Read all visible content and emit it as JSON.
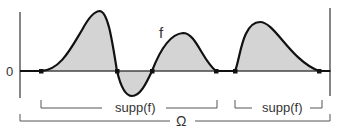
{
  "diagram": {
    "function_label": "f",
    "zero_label": "0",
    "support_labels": [
      "supp(f)",
      "supp(f)"
    ],
    "domain_label": "Ω",
    "colors": {
      "curve": "#111111",
      "fill": "#d4d4d4",
      "axis": "#444444",
      "bracket": "#555555",
      "text": "#333333"
    },
    "points_on_axis": [
      41,
      117,
      152,
      216,
      235,
      319
    ]
  }
}
